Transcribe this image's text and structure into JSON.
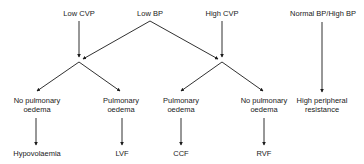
{
  "diagram": {
    "type": "decision-tree",
    "inputs": [
      {
        "id": "low_cvp",
        "label": "Low CVP"
      },
      {
        "id": "low_bp",
        "label": "Low BP"
      },
      {
        "id": "high_cvp",
        "label": "High CVP"
      },
      {
        "id": "normal_high_bp",
        "label": "Normal BP/High BP"
      }
    ],
    "findings": [
      {
        "id": "no_po_left",
        "line1": "No pulmonary",
        "line2": "oedema"
      },
      {
        "id": "po_left",
        "line1": "Pulmonary",
        "line2": "oedema"
      },
      {
        "id": "po_right",
        "line1": "Pulmonary",
        "line2": "oedema"
      },
      {
        "id": "no_po_right",
        "line1": "No pulmonary",
        "line2": "oedema"
      },
      {
        "id": "hpr",
        "line1": "High peripheral",
        "line2": "resistance"
      }
    ],
    "diagnoses": [
      {
        "id": "hypovolaemia",
        "label": "Hypovolaemia"
      },
      {
        "id": "lvf",
        "label": "LVF"
      },
      {
        "id": "ccf",
        "label": "CCF"
      },
      {
        "id": "rvf",
        "label": "RVF"
      }
    ],
    "edges": [
      [
        "Low CVP",
        "left junction"
      ],
      [
        "Low BP",
        "left junction"
      ],
      [
        "Low BP",
        "right junction"
      ],
      [
        "High CVP",
        "right junction"
      ],
      [
        "left junction",
        "No pulmonary oedema"
      ],
      [
        "left junction",
        "Pulmonary oedema"
      ],
      [
        "right junction",
        "Pulmonary oedema"
      ],
      [
        "right junction",
        "No pulmonary oedema"
      ],
      [
        "No pulmonary oedema",
        "Hypovolaemia"
      ],
      [
        "Pulmonary oedema",
        "LVF"
      ],
      [
        "Pulmonary oedema",
        "CCF"
      ],
      [
        "No pulmonary oedema",
        "RVF"
      ],
      [
        "Normal BP/High BP",
        "High peripheral resistance"
      ]
    ],
    "line_color": "#1a1a1a"
  }
}
